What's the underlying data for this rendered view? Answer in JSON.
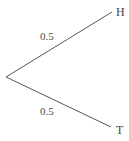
{
  "diagram": {
    "kind": "probability-tree",
    "background_color": "#ffffff",
    "line_color": "#555555",
    "text_color": "#444444",
    "root": {
      "name": "root-node",
      "label": "",
      "x": 6,
      "y": 77
    },
    "branches": [
      {
        "name": "branch-heads",
        "probability": "0.5",
        "outcome": "H",
        "from_x": 6,
        "from_y": 77,
        "to_x": 112,
        "to_y": 12
      },
      {
        "name": "branch-tails",
        "probability": "0.5",
        "outcome": "T",
        "from_x": 6,
        "from_y": 77,
        "to_x": 111,
        "to_y": 127
      }
    ]
  },
  "chart_data": {
    "type": "diagram",
    "title": "",
    "categories": [
      "H",
      "T"
    ],
    "values": [
      0.5,
      0.5
    ],
    "labels": [
      "0.5",
      "0.5"
    ],
    "xlabel": "",
    "ylabel": ""
  }
}
